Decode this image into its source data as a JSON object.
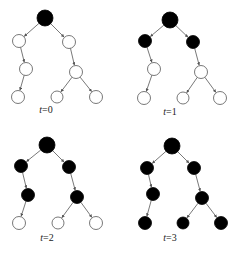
{
  "diagram": {
    "edges": [
      [
        0,
        1
      ],
      [
        0,
        2
      ],
      [
        1,
        3
      ],
      [
        2,
        4
      ],
      [
        3,
        5
      ],
      [
        4,
        6
      ],
      [
        4,
        7
      ]
    ],
    "colors": {
      "filled": "#000000",
      "empty": "#ffffff",
      "stroke": "#555555"
    },
    "panels": [
      {
        "label_var": "t",
        "label_eq": "=0",
        "label": "t=0",
        "label_pos": [
          46,
          113
        ],
        "nodes": [
          {
            "x": 45,
            "y": 18,
            "r": 8,
            "filled": true
          },
          {
            "x": 19,
            "y": 41,
            "r": 6.5,
            "filled": false
          },
          {
            "x": 69,
            "y": 42,
            "r": 6.5,
            "filled": false
          },
          {
            "x": 26,
            "y": 69,
            "r": 6.5,
            "filled": false
          },
          {
            "x": 76,
            "y": 72,
            "r": 6.5,
            "filled": false
          },
          {
            "x": 18,
            "y": 97,
            "r": 6.5,
            "filled": false
          },
          {
            "x": 57,
            "y": 97,
            "r": 6,
            "filled": false
          },
          {
            "x": 96,
            "y": 97,
            "r": 6.5,
            "filled": false
          }
        ]
      },
      {
        "label_var": "t",
        "label_eq": "=1",
        "label": "t=1",
        "label_pos": [
          170,
          115
        ],
        "nodes": [
          {
            "x": 170,
            "y": 20,
            "r": 8,
            "filled": true
          },
          {
            "x": 145,
            "y": 41,
            "r": 6.5,
            "filled": true
          },
          {
            "x": 193,
            "y": 42,
            "r": 6.5,
            "filled": true
          },
          {
            "x": 154,
            "y": 69,
            "r": 6.5,
            "filled": false
          },
          {
            "x": 201,
            "y": 72,
            "r": 6.5,
            "filled": false
          },
          {
            "x": 144,
            "y": 98,
            "r": 6.5,
            "filled": false
          },
          {
            "x": 183,
            "y": 98,
            "r": 6,
            "filled": false
          },
          {
            "x": 220,
            "y": 98,
            "r": 6.5,
            "filled": false
          }
        ]
      },
      {
        "label_var": "t",
        "label_eq": "=2",
        "label": "t=2",
        "label_pos": [
          47,
          241
        ],
        "nodes": [
          {
            "x": 47,
            "y": 145,
            "r": 8,
            "filled": true
          },
          {
            "x": 21,
            "y": 166,
            "r": 6.5,
            "filled": true
          },
          {
            "x": 69,
            "y": 167,
            "r": 6.5,
            "filled": true
          },
          {
            "x": 28,
            "y": 195,
            "r": 6.5,
            "filled": true
          },
          {
            "x": 77,
            "y": 197,
            "r": 6.5,
            "filled": true
          },
          {
            "x": 19,
            "y": 223,
            "r": 6.5,
            "filled": false
          },
          {
            "x": 58,
            "y": 223,
            "r": 6,
            "filled": false
          },
          {
            "x": 96,
            "y": 223,
            "r": 6.5,
            "filled": false
          }
        ]
      },
      {
        "label_var": "t",
        "label_eq": "=3",
        "label": "t=3",
        "label_pos": [
          170,
          241
        ],
        "nodes": [
          {
            "x": 172,
            "y": 146,
            "r": 8,
            "filled": true
          },
          {
            "x": 147,
            "y": 168,
            "r": 6.5,
            "filled": true
          },
          {
            "x": 194,
            "y": 168,
            "r": 6.5,
            "filled": true
          },
          {
            "x": 153,
            "y": 194,
            "r": 6.5,
            "filled": true
          },
          {
            "x": 202,
            "y": 198,
            "r": 6.5,
            "filled": true
          },
          {
            "x": 145,
            "y": 223,
            "r": 6.5,
            "filled": true
          },
          {
            "x": 183,
            "y": 223,
            "r": 6,
            "filled": true
          },
          {
            "x": 221,
            "y": 223,
            "r": 6.5,
            "filled": true
          }
        ]
      }
    ]
  }
}
